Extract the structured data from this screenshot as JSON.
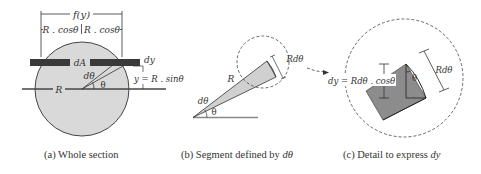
{
  "figure": {
    "panels": [
      {
        "id": "a",
        "caption_prefix": "(a) Whole section",
        "caption_italic": "",
        "labels": {
          "width_function": "f(y)",
          "half_width_left": "R . cosθ",
          "half_width_right": "R . cosθ",
          "area_element": "dA",
          "radius": "R",
          "angle_increment": "dθ",
          "angle": "θ",
          "thickness": "dy",
          "height": "y = R . sinθ"
        }
      },
      {
        "id": "b",
        "caption_prefix": "(b) Segment defined by ",
        "caption_italic": "dθ",
        "labels": {
          "radius": "R",
          "angle_increment": "dθ",
          "angle": "θ",
          "arc_length": "Rdθ"
        }
      },
      {
        "id": "c",
        "caption_prefix": "(c) Detail to express ",
        "caption_italic": "dy",
        "labels": {
          "expression": "dy = Rdθ . cosθ",
          "angle": "θ",
          "arc_length": "Rdθ"
        }
      }
    ],
    "colors": {
      "section_fill": "#d9d9d9",
      "strip_fill": "#3a3a3a",
      "wedge_fill": "#d0d0d0",
      "detail_fill": "#8c8c8c",
      "line": "#333333"
    }
  }
}
